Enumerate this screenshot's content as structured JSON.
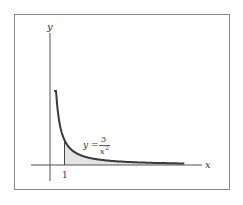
{
  "figure": {
    "x_axis_label": "x",
    "y_axis_label": "y",
    "tick_label_1": "1",
    "equation": {
      "lhs": "y =",
      "numerator": "3",
      "denominator": "x",
      "exponent": "2"
    },
    "colors": {
      "curve": "#3a3a3a",
      "axis": "#555555",
      "shade": "#e3e3e3",
      "frame": "#888888"
    },
    "function": "3/x^2",
    "shaded_region": {
      "from_x": 1,
      "to_x": "infinity"
    }
  }
}
